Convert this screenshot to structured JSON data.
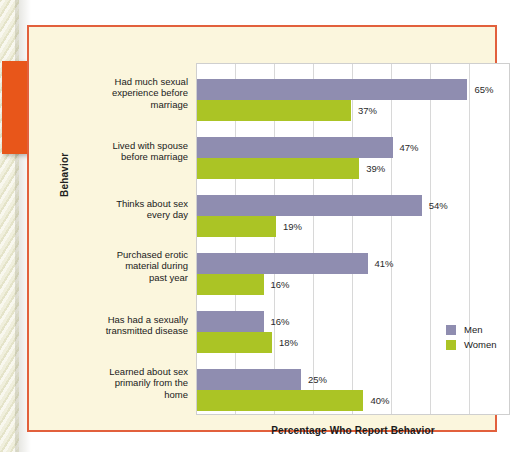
{
  "figure": {
    "x_axis_title": "Percentage Who Report Behavior",
    "y_axis_title": "Behavior",
    "accent_border_color": "#e2603c",
    "panel_background": "#fbf6dd",
    "marker_icon": "orange-arrow-icon"
  },
  "legend": {
    "position": "inside-right",
    "entries": [
      {
        "label": "Men",
        "color": "#8f8db0",
        "swatch_icon": "men-color-swatch"
      },
      {
        "label": "Women",
        "color": "#abc425",
        "swatch_icon": "women-color-swatch"
      }
    ]
  },
  "chart_data": {
    "type": "bar",
    "orientation": "horizontal",
    "title": "",
    "subtitle": "",
    "xlabel": "Percentage Who Report Behavior",
    "ylabel": "Behavior",
    "xlim": [
      0,
      75
    ],
    "xtick_step": 9.375,
    "grid": true,
    "tick_labels_visible": false,
    "categories": [
      "Had much sexual experience before marriage",
      "Lived with spouse before marriage",
      "Thinks about sex every day",
      "Purchased erotic material during past year",
      "Has had a sexually transmitted disease",
      "Learned about sex primarily from the home"
    ],
    "category_lines": [
      [
        "Had much sexual",
        "experience before",
        "marriage"
      ],
      [
        "Lived with spouse",
        "before marriage"
      ],
      [
        "Thinks about sex",
        "every day"
      ],
      [
        "Purchased erotic",
        "material during",
        "past year"
      ],
      [
        "Has had a sexually",
        "transmitted disease"
      ],
      [
        "Learned about sex",
        "primarily from the",
        "home"
      ]
    ],
    "series": [
      {
        "name": "Men",
        "color": "#8f8db0",
        "values": [
          65,
          47,
          54,
          41,
          16,
          25
        ],
        "value_labels": [
          "65%",
          "47%",
          "54%",
          "41%",
          "16%",
          "25%"
        ]
      },
      {
        "name": "Women",
        "color": "#abc425",
        "values": [
          37,
          39,
          19,
          16,
          18,
          40
        ],
        "value_labels": [
          "37%",
          "39%",
          "19%",
          "16%",
          "18%",
          "40%"
        ]
      }
    ]
  }
}
